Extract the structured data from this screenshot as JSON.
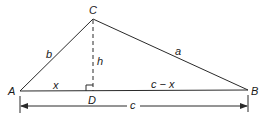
{
  "diagram": {
    "type": "triangle-with-altitude",
    "vertices": {
      "A": {
        "label": "A",
        "x": 20,
        "y": 91
      },
      "B": {
        "label": "B",
        "x": 248,
        "y": 90
      },
      "C": {
        "label": "C",
        "x": 93,
        "y": 19
      },
      "D": {
        "label": "D",
        "x": 93,
        "y": 91
      }
    },
    "side_labels": {
      "b": "b",
      "a": "a",
      "h": "h",
      "x": "x",
      "c_minus_x": "c − x",
      "c": "c"
    },
    "colors": {
      "line": "#2a2a2a",
      "text": "#1a1a1a",
      "background": "#ffffff"
    }
  }
}
